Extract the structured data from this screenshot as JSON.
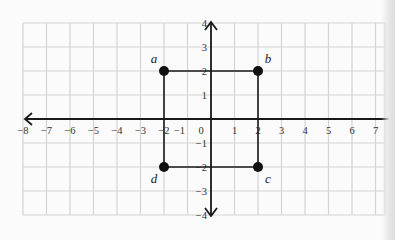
{
  "chart_data": {
    "type": "scatter",
    "title": "",
    "xlabel": "",
    "ylabel": "",
    "xlim": [
      -8,
      7.5
    ],
    "ylim": [
      -4,
      4
    ],
    "grid": true,
    "x_ticks": [
      -8,
      -7,
      -6,
      -5,
      -4,
      -3,
      -2,
      -1,
      0,
      1,
      2,
      3,
      4,
      5,
      6,
      7
    ],
    "x_tick_labels": [
      "−8",
      "−7",
      "−6",
      "−5",
      "−4",
      "−3",
      "−2",
      "−1",
      "0",
      "1",
      "2",
      "3",
      "4",
      "5",
      "6",
      "7"
    ],
    "y_ticks": [
      4,
      3,
      2,
      1,
      -1,
      -2,
      -3,
      -4
    ],
    "y_tick_labels": [
      "4",
      "3",
      "2",
      "1",
      "−1",
      "−2",
      "−3",
      "−4"
    ],
    "points": [
      {
        "label": "a",
        "x": -2,
        "y": 2
      },
      {
        "label": "b",
        "x": 2,
        "y": 2
      },
      {
        "label": "c",
        "x": 2,
        "y": -2
      },
      {
        "label": "d",
        "x": -2,
        "y": -2
      }
    ],
    "polygon": [
      "a",
      "b",
      "c",
      "d"
    ],
    "annotations": [
      "a",
      "b",
      "c",
      "d"
    ]
  },
  "colors": {
    "grid": "#d4d4d4",
    "axis": "#1a1a1a",
    "point": "#111111",
    "label": "#222222",
    "background": "#fbfbfb"
  }
}
